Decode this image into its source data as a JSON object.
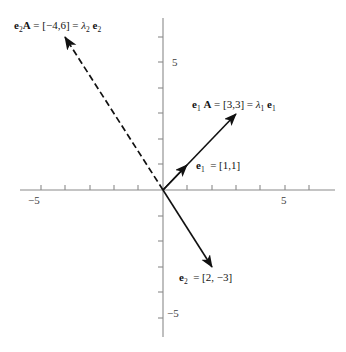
{
  "figure": {
    "background": "#ffffff",
    "axis_color": "#7a7a7a",
    "vector_color": "#111111"
  },
  "axes": {
    "origin_px": {
      "x": 163,
      "y": 190
    },
    "unit_px": {
      "x": 24.4,
      "y": 25.6
    },
    "x_axis": {
      "start_px": 20,
      "end_px": 335
    },
    "y_axis": {
      "start_px": 18,
      "end_px": 337
    },
    "x_ticks": [
      {
        "value": -5,
        "label": "−5",
        "show_label": true
      },
      {
        "value": -4,
        "label": "",
        "show_label": false
      },
      {
        "value": -3,
        "label": "",
        "show_label": false
      },
      {
        "value": -2,
        "label": "",
        "show_label": false
      },
      {
        "value": -1,
        "label": "",
        "show_label": false
      },
      {
        "value": 1,
        "label": "",
        "show_label": false
      },
      {
        "value": 2,
        "label": "",
        "show_label": false
      },
      {
        "value": 3,
        "label": "",
        "show_label": false
      },
      {
        "value": 4,
        "label": "",
        "show_label": false
      },
      {
        "value": 5,
        "label": "5",
        "show_label": true
      },
      {
        "value": 6,
        "label": "",
        "show_label": false
      }
    ],
    "y_ticks": [
      {
        "value": 6,
        "label": "",
        "show_label": false
      },
      {
        "value": 5,
        "label": "5",
        "show_label": true
      },
      {
        "value": 4,
        "label": "",
        "show_label": false
      },
      {
        "value": 3,
        "label": "",
        "show_label": false
      },
      {
        "value": 2,
        "label": "",
        "show_label": false
      },
      {
        "value": 1,
        "label": "",
        "show_label": false
      },
      {
        "value": -1,
        "label": "",
        "show_label": false
      },
      {
        "value": -2,
        "label": "",
        "show_label": false
      },
      {
        "value": -3,
        "label": "",
        "show_label": false
      },
      {
        "value": -4,
        "label": "",
        "show_label": false
      },
      {
        "value": -5,
        "label": "−5",
        "show_label": true
      }
    ],
    "tick_length_px": 5
  },
  "chart_data": {
    "type": "scatter",
    "title": "",
    "xlabel": "",
    "ylabel": "",
    "xlim": [
      -5.9,
      7.0
    ],
    "ylim": [
      -5.7,
      6.7
    ],
    "grid": false,
    "legend": "none",
    "vectors": [
      {
        "name": "e1",
        "label_html": "<span class='bf'>e</span><sub>1</sub> = [1,1]",
        "label_plain": "e₁ = [1,1]",
        "from": [
          0,
          0
        ],
        "to": [
          1,
          1
        ],
        "style": "solid",
        "arrow": true
      },
      {
        "name": "e1A",
        "label_html": "<span class='bf'>e</span><sub>1</sub> <span class='bf'>A</span> = [3,3] = <span class='it'>λ</span><sub>1</sub> <span class='bf'>e</span><sub>1</sub>",
        "label_plain": "e₁A = [3,3] = λ₁e₁",
        "from": [
          0,
          0
        ],
        "to": [
          3,
          3
        ],
        "style": "solid",
        "arrow": true
      },
      {
        "name": "e2",
        "label_html": "<span class='bf'>e</span><sub>2</sub> = [2, −3]",
        "label_plain": "e₂ = [2,−3]",
        "from": [
          0,
          0
        ],
        "to": [
          2,
          -3
        ],
        "style": "solid",
        "arrow": true
      },
      {
        "name": "e2A",
        "label_html": "<span class='bf'>e</span><sub>2</sub><span class='bf'>A</span> = [−4,6] = <span class='it'>λ</span><sub>2</sub> <span class='bf'>e</span><sub>2</sub>",
        "label_plain": "e₂A = [−4,6] = λ₂e₂",
        "from": [
          0,
          0
        ],
        "to": [
          -4,
          6
        ],
        "style": "dashed",
        "arrow": true
      }
    ]
  },
  "labels": {
    "e2A": "e2A = [−4,6] = λ2e2",
    "e1A": "e1 A = [3,3] = λ1 e1",
    "e1": "e1 = [1,1]",
    "e2": "e2 = [2, −3]",
    "x_neg5": "−5",
    "x_pos5": "5",
    "y_pos5": "5",
    "y_neg5": "−5"
  }
}
